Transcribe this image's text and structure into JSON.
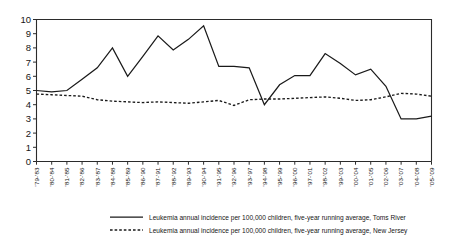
{
  "chart_data": {
    "type": "line",
    "title": "",
    "subtitle": "",
    "xlabel": "",
    "ylabel": "",
    "ylim": [
      0,
      10
    ],
    "yticks": [
      0,
      1,
      2,
      3,
      4,
      5,
      6,
      7,
      8,
      9,
      10
    ],
    "grid": false,
    "legend_position": "bottom",
    "categories": [
      "'79-'83",
      "'80-'84",
      "'81-'85",
      "'82-'86",
      "'83-'87",
      "'84-'88",
      "'85-'89",
      "'86-'90",
      "'87-'91",
      "'88-'92",
      "'89-'93",
      "'90-'94",
      "'91-'95",
      "'92-'96",
      "'93-'97",
      "'94-'98",
      "'95-'99",
      "'96-'00",
      "'97-'01",
      "'98-'02",
      "'99-'03",
      "'00-'04",
      "'01-'05",
      "'02-'06",
      "'03-'07",
      "'04-'08",
      "'05-'09"
    ],
    "series": [
      {
        "name": "Leukemia annual incidence per 100,000 children, five-year running average, Toms River",
        "style": "solid",
        "color": "#1a1a1a",
        "values": [
          5.0,
          4.9,
          5.0,
          5.8,
          6.6,
          8.0,
          6.0,
          7.4,
          8.85,
          7.85,
          8.6,
          9.55,
          6.7,
          6.7,
          6.6,
          4.0,
          5.4,
          6.05,
          6.05,
          7.6,
          6.9,
          6.1,
          6.5,
          5.3,
          3.0,
          3.0,
          3.2
        ]
      },
      {
        "name": "Leukemia annual incidence per 100,000 children, five-year running average, New Jersey",
        "style": "dashed",
        "color": "#1a1a1a",
        "values": [
          4.75,
          4.7,
          4.65,
          4.6,
          4.35,
          4.25,
          4.2,
          4.15,
          4.2,
          4.15,
          4.1,
          4.2,
          4.3,
          3.95,
          4.35,
          4.4,
          4.4,
          4.45,
          4.5,
          4.55,
          4.45,
          4.3,
          4.35,
          4.55,
          4.8,
          4.75,
          4.6
        ]
      }
    ]
  },
  "legend": {
    "items": [
      {
        "label": "Leukemia annual incidence per 100,000 children, five-year running average, Toms River",
        "style": "solid"
      },
      {
        "label": "Leukemia annual incidence per 100,000 children, five-year running average, New Jersey",
        "style": "dashed"
      }
    ]
  }
}
